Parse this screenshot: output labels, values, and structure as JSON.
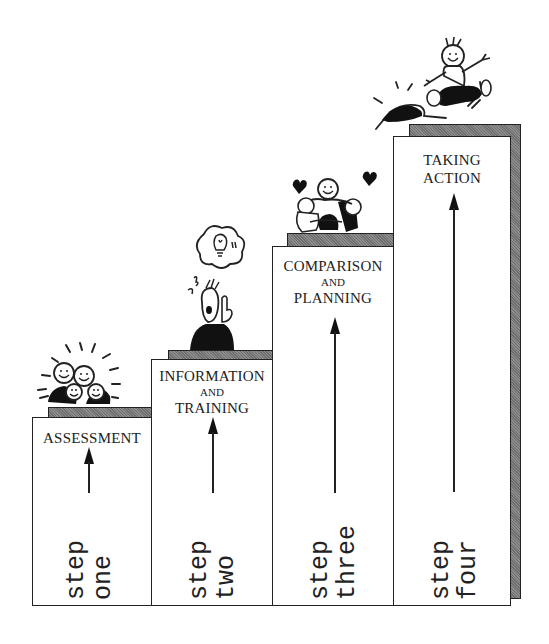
{
  "diagram": {
    "type": "staircase",
    "steps": [
      {
        "title_lines": [
          "ASSESSMENT"
        ],
        "connector": "",
        "step_word": "step",
        "ordinal": "one",
        "illustration": "group-of-smiling-people"
      },
      {
        "title_lines": [
          "INFORMATION",
          "TRAINING"
        ],
        "connector": "AND",
        "step_word": "step",
        "ordinal": "two",
        "illustration": "person-with-lightbulb-idea"
      },
      {
        "title_lines": [
          "COMPARISON",
          "PLANNING"
        ],
        "connector": "AND",
        "step_word": "step",
        "ordinal": "three",
        "illustration": "group-hug-with-hearts"
      },
      {
        "title_lines": [
          "TAKING",
          "ACTION"
        ],
        "connector": "",
        "step_word": "step",
        "ordinal": "four",
        "illustration": "person-jumping-for-joy"
      }
    ],
    "colors": {
      "line": "#222222",
      "shadow": "#7a7a7a",
      "background": "#ffffff"
    }
  }
}
